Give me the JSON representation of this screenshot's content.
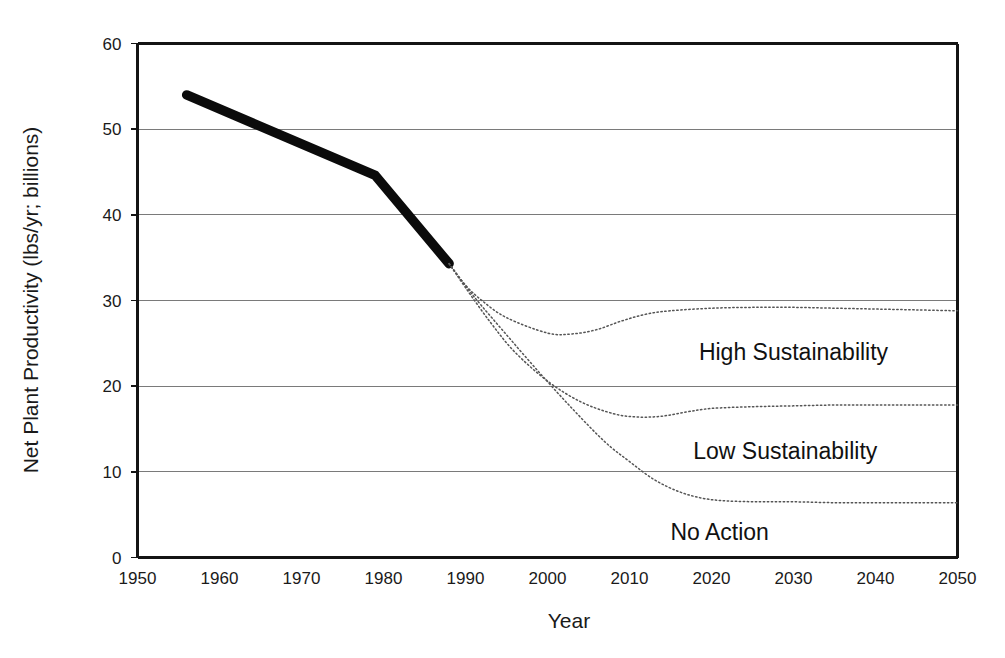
{
  "chart_data": {
    "type": "line",
    "title": "",
    "xlabel": "Year",
    "ylabel": "Net Plant Productivity (lbs/yr; billions)",
    "xlim": [
      1950,
      2050
    ],
    "ylim": [
      0,
      60
    ],
    "xticks": [
      1950,
      1960,
      1970,
      1980,
      1990,
      2000,
      2010,
      2020,
      2030,
      2040,
      2050
    ],
    "yticks": [
      0,
      10,
      20,
      30,
      40,
      50,
      60
    ],
    "grid": "horizontal",
    "legend_position": "inline-annotations",
    "series": [
      {
        "name": "Historical",
        "style": "solid-thick-black",
        "x": [
          1956,
          1979,
          1988
        ],
        "values": [
          54.0,
          44.6,
          34.3
        ]
      },
      {
        "name": "High Sustainability",
        "style": "dotted",
        "x": [
          1988,
          1990,
          1992,
          1995,
          2000,
          2003,
          2006,
          2009,
          2012,
          2015,
          2020,
          2025,
          2030,
          2035,
          2040,
          2045,
          2050
        ],
        "values": [
          34.3,
          31.8,
          30.0,
          28.0,
          26.2,
          26.1,
          26.6,
          27.6,
          28.4,
          28.8,
          29.1,
          29.2,
          29.2,
          29.1,
          29.0,
          28.9,
          28.8
        ]
      },
      {
        "name": "Low Sustainability",
        "style": "dotted",
        "x": [
          1988,
          1990,
          1993,
          1996,
          2000,
          2004,
          2008,
          2011,
          2014,
          2017,
          2020,
          2025,
          2030,
          2035,
          2040,
          2045,
          2050
        ],
        "values": [
          34.3,
          31.5,
          27.5,
          24.0,
          20.6,
          18.2,
          16.8,
          16.4,
          16.5,
          17.0,
          17.4,
          17.6,
          17.7,
          17.8,
          17.8,
          17.8,
          17.8
        ]
      },
      {
        "name": "No Action",
        "style": "dotted",
        "x": [
          1988,
          1991,
          1995,
          1999,
          2003,
          2007,
          2010,
          2013,
          2016,
          2019,
          2022,
          2026,
          2030,
          2035,
          2040,
          2045,
          2050
        ],
        "values": [
          34.3,
          30.5,
          26.0,
          21.6,
          17.4,
          13.5,
          11.2,
          9.1,
          7.7,
          6.9,
          6.6,
          6.5,
          6.5,
          6.4,
          6.4,
          6.4,
          6.4
        ]
      }
    ],
    "annotations": [
      {
        "text": "High Sustainability",
        "x": 2030,
        "y": 23.0
      },
      {
        "text": "Low Sustainability",
        "x": 2029,
        "y": 11.5
      },
      {
        "text": "No Action",
        "x": 2021,
        "y": 2.0
      }
    ]
  },
  "colors": {
    "historical_line": "#0b0b0b",
    "projection_line": "#555555",
    "gridline": "#7a7a7a",
    "axis": "#141414",
    "background": "#ffffff",
    "text": "#1a1a1a"
  }
}
